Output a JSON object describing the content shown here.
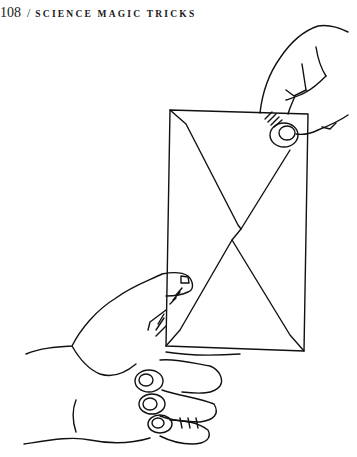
{
  "header": {
    "page_number": "108",
    "separator": "/",
    "running_title": "SCIENCE MAGIC TRICKS"
  },
  "figure": {
    "icon": "envelope-held-by-two-hands-illustration"
  }
}
